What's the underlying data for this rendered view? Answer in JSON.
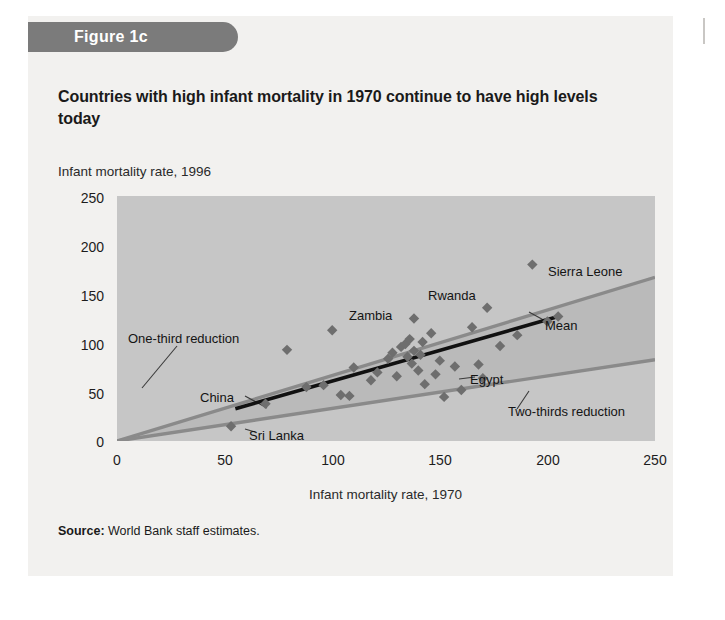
{
  "figure": {
    "banner_label": "Figure 1c",
    "title": "Countries with high infant mortality in 1970 continue to have high levels today",
    "source_prefix": "Source:",
    "source_text": "World Bank staff estimates."
  },
  "chart_data": {
    "type": "scatter",
    "title": "Countries with high infant mortality in 1970 continue to have high levels today",
    "xlabel": "Infant mortality rate, 1970",
    "ylabel": "Infant mortality rate, 1996",
    "xlim": [
      0,
      250
    ],
    "ylim": [
      0,
      250
    ],
    "xticks": [
      0,
      50,
      100,
      150,
      200,
      250
    ],
    "yticks": [
      0,
      50,
      100,
      150,
      200,
      250
    ],
    "grid": false,
    "legend": "none",
    "plot_bg": "#c6c6c6",
    "band_fill": "#b0b0b0",
    "reference_line_color": "#8a8a8a",
    "mean_line_color": "#111111",
    "marker_color": "#6e6e6e",
    "marker_shape": "diamond",
    "points": [
      {
        "x": 53,
        "y": 15,
        "label": "Sri Lanka"
      },
      {
        "x": 69,
        "y": 38,
        "label": "China"
      },
      {
        "x": 79,
        "y": 93,
        "label": ""
      },
      {
        "x": 88,
        "y": 55,
        "label": ""
      },
      {
        "x": 96,
        "y": 57,
        "label": ""
      },
      {
        "x": 100,
        "y": 113,
        "label": "Zambia"
      },
      {
        "x": 104,
        "y": 47,
        "label": ""
      },
      {
        "x": 108,
        "y": 46,
        "label": ""
      },
      {
        "x": 110,
        "y": 75,
        "label": ""
      },
      {
        "x": 118,
        "y": 62,
        "label": ""
      },
      {
        "x": 121,
        "y": 70,
        "label": ""
      },
      {
        "x": 126,
        "y": 84,
        "label": ""
      },
      {
        "x": 128,
        "y": 90,
        "label": ""
      },
      {
        "x": 130,
        "y": 66,
        "label": ""
      },
      {
        "x": 132,
        "y": 96,
        "label": ""
      },
      {
        "x": 134,
        "y": 99,
        "label": ""
      },
      {
        "x": 135,
        "y": 86,
        "label": ""
      },
      {
        "x": 136,
        "y": 104,
        "label": ""
      },
      {
        "x": 137,
        "y": 79,
        "label": ""
      },
      {
        "x": 138,
        "y": 92,
        "label": ""
      },
      {
        "x": 138,
        "y": 125,
        "label": "Rwanda"
      },
      {
        "x": 140,
        "y": 72,
        "label": ""
      },
      {
        "x": 141,
        "y": 88,
        "label": ""
      },
      {
        "x": 142,
        "y": 101,
        "label": ""
      },
      {
        "x": 143,
        "y": 58,
        "label": ""
      },
      {
        "x": 146,
        "y": 110,
        "label": ""
      },
      {
        "x": 148,
        "y": 68,
        "label": ""
      },
      {
        "x": 150,
        "y": 82,
        "label": ""
      },
      {
        "x": 152,
        "y": 45,
        "label": ""
      },
      {
        "x": 157,
        "y": 76,
        "label": ""
      },
      {
        "x": 160,
        "y": 52,
        "label": "Egypt"
      },
      {
        "x": 165,
        "y": 116,
        "label": ""
      },
      {
        "x": 168,
        "y": 78,
        "label": ""
      },
      {
        "x": 170,
        "y": 64,
        "label": ""
      },
      {
        "x": 172,
        "y": 136,
        "label": ""
      },
      {
        "x": 178,
        "y": 97,
        "label": ""
      },
      {
        "x": 186,
        "y": 108,
        "label": ""
      },
      {
        "x": 193,
        "y": 180,
        "label": "Sierra Leone"
      },
      {
        "x": 200,
        "y": 122,
        "label": ""
      },
      {
        "x": 205,
        "y": 127,
        "label": ""
      }
    ],
    "reference_lines": [
      {
        "name": "One-third reduction",
        "from": [
          0,
          0
        ],
        "to": [
          250,
          167
        ],
        "note": "upper band edge"
      },
      {
        "name": "Two-thirds reduction",
        "from": [
          0,
          0
        ],
        "to": [
          250,
          83
        ],
        "note": "lower band edge"
      }
    ],
    "trend_line": {
      "name": "Mean",
      "from": [
        55,
        33
      ],
      "to": [
        205,
        127
      ]
    }
  },
  "annotations": {
    "one_third": "One-third reduction",
    "two_thirds": "Two-thirds reduction",
    "mean": "Mean",
    "china": "China",
    "sri_lanka": "Sri Lanka",
    "zambia": "Zambia",
    "rwanda": "Rwanda",
    "egypt": "Egypt",
    "sierra_leone": "Sierra Leone"
  },
  "axes": {
    "y_title": "Infant mortality rate, 1996",
    "x_title": "Infant mortality rate, 1970",
    "yticks": [
      "250",
      "200",
      "150",
      "100",
      "50",
      "0"
    ],
    "xticks": [
      "0",
      "50",
      "100",
      "150",
      "200",
      "250"
    ]
  }
}
